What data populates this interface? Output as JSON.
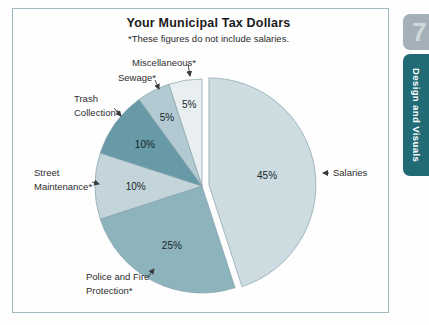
{
  "chart_data": {
    "type": "pie",
    "title": "Your Municipal Tax Dollars",
    "subtitle": "*These figures do not include salaries.",
    "direction": "clockwise",
    "start_angle_deg": 0,
    "slices": [
      {
        "name": "Salaries",
        "value": 45,
        "pct_label": "45%",
        "color": "#ccdce1",
        "exploded": true
      },
      {
        "name": "Police and Fire Protection*",
        "value": 25,
        "pct_label": "25%",
        "color": "#8db3bd",
        "exploded": false
      },
      {
        "name": "Street Maintenance*",
        "value": 10,
        "pct_label": "10%",
        "color": "#c3d5da",
        "exploded": false
      },
      {
        "name": "Trash Collection*",
        "value": 10,
        "pct_label": "10%",
        "color": "#6799a7",
        "exploded": false
      },
      {
        "name": "Sewage*",
        "value": 5,
        "pct_label": "5%",
        "color": "#b4cad2",
        "exploded": false
      },
      {
        "name": "Miscellaneous*",
        "value": 5,
        "pct_label": "5%",
        "color": "#e9eff1",
        "exploded": false
      }
    ],
    "slice_outline_color": "#85a2ab",
    "box_border_color": "#9fb9be"
  },
  "sidebar_tab": {
    "number": "7",
    "label": "Design and Visuals",
    "number_bg": "#a4b0b8",
    "label_bg": "#206b76"
  }
}
